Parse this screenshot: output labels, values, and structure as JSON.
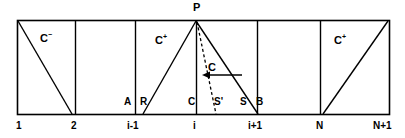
{
  "figure": {
    "title_label": "P",
    "axis_ticks": [
      {
        "label": "1",
        "x": 20
      },
      {
        "label": "2",
        "x": 75
      },
      {
        "label": "i-1",
        "x": 135
      },
      {
        "label": "i",
        "x": 196
      },
      {
        "label": "i+1",
        "x": 257
      },
      {
        "label": "N",
        "x": 320
      },
      {
        "label": "N+1",
        "x": 380
      }
    ],
    "node_labels": [
      {
        "label": "A",
        "x": 124,
        "y": 97
      },
      {
        "label": "R",
        "x": 140,
        "y": 97
      },
      {
        "label": "C",
        "x": 188,
        "y": 97
      },
      {
        "label": "S'",
        "x": 214,
        "y": 97
      },
      {
        "label": "S",
        "x": 240,
        "y": 97
      },
      {
        "label": "B",
        "x": 256,
        "y": 97
      }
    ],
    "region_labels": [
      {
        "base": "C",
        "sup": "−",
        "x": 40,
        "y": 31
      },
      {
        "base": "C",
        "sup": "+",
        "x": 155,
        "y": 33
      },
      {
        "base": "C",
        "sup": "",
        "x": 208,
        "y": 60
      },
      {
        "base": "C",
        "sup": "+",
        "x": 334,
        "y": 33
      }
    ],
    "apex": {
      "label": "P",
      "x": 193,
      "y": 2
    },
    "colors": {
      "stroke": "#000000",
      "background": "#ffffff",
      "text": "#000000"
    },
    "geometry": {
      "frame_left": 17,
      "frame_right": 390,
      "frame_top": 20,
      "frame_bottom": 114,
      "cell_dividers": [
        75,
        135,
        196,
        257,
        320
      ],
      "apex_point": [
        196,
        20
      ],
      "triangle_left_foot": [
        143,
        114
      ],
      "triangle_right_foot": [
        258,
        114
      ],
      "dashed_foot": [
        216,
        114
      ],
      "left_diagonal": [
        [
          17,
          20
        ],
        [
          72,
          114
        ]
      ],
      "right_diagonal": [
        [
          323,
          114
        ],
        [
          388,
          20
        ]
      ],
      "arrow_tail": [
        242,
        75
      ],
      "arrow_head": [
        203,
        75
      ]
    }
  }
}
